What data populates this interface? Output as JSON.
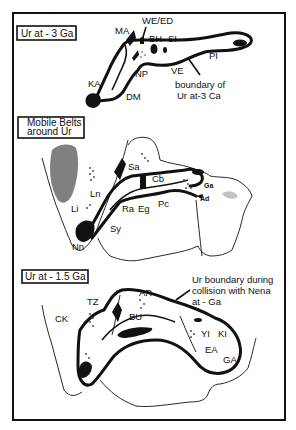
{
  "figure": {
    "frame": {
      "x": 13,
      "y": 13,
      "width": 272,
      "height": 407
    },
    "colors": {
      "ink": "#111111",
      "background": "#ffffff",
      "shade": "#555555"
    }
  },
  "panels": [
    {
      "title": "Ur at - 3 Ga",
      "labels": {
        "MA": "MA",
        "WE_ED": "WE/ED",
        "BH": "BH",
        "SI": "SI",
        "PI": "PI",
        "NP": "NP",
        "VE": "VE",
        "KA": "KA",
        "DM": "DM"
      },
      "annotation_line1": "boundary of",
      "annotation_line2": "Ur at-3 Ca"
    },
    {
      "title_line1": "Mobile Belts",
      "title_line2": "around Ur",
      "labels": {
        "Sa": "Sa",
        "Cb": "Cb",
        "Ga": "Ga",
        "Ad": "Ad",
        "Ln": "Ln",
        "Li": "Li",
        "Ra": "Ra",
        "Eg": "Eg",
        "Pc": "Pc",
        "Sy": "Sy",
        "Nn": "Nn"
      }
    },
    {
      "title": "Ur at - 1.5 Ga",
      "labels": {
        "TZ": "TZ",
        "CK": "CK",
        "AR": "AR",
        "BU": "BU",
        "YI": "YI",
        "KI": "KI",
        "EA": "EA",
        "GA": "GA"
      },
      "annotation_line1": "Ur boundary during",
      "annotation_line2": "collision with Nena",
      "annotation_line3": "at - Ga"
    }
  ]
}
